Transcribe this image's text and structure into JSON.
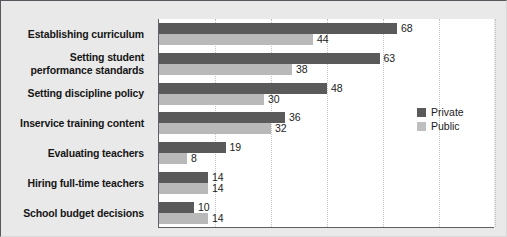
{
  "chart_data": {
    "type": "bar",
    "orientation": "horizontal",
    "title": "",
    "subtitle": "",
    "xlabel": "",
    "ylabel": "",
    "xlim": [
      0,
      96
    ],
    "grid": true,
    "gridline_values": [
      16,
      32,
      48,
      64,
      80,
      96
    ],
    "legend_position": "center-right",
    "categories": [
      "Establishing curriculum",
      "Setting student\nperformance standards",
      "Setting discipline policy",
      "Inservice training content",
      "Evaluating teachers",
      "Hiring full-time teachers",
      "School budget decisions"
    ],
    "series": [
      {
        "name": "Private",
        "color": "#5a5a5a",
        "values": [
          68,
          63,
          48,
          36,
          19,
          14,
          10
        ]
      },
      {
        "name": "Public",
        "color": "#b9b9b9",
        "values": [
          44,
          38,
          30,
          32,
          8,
          14,
          14
        ]
      }
    ]
  },
  "categories": [
    {
      "line1": "Establishing curriculum",
      "line2": ""
    },
    {
      "line1": "Setting student",
      "line2": "performance standards"
    },
    {
      "line1": "Setting discipline policy",
      "line2": ""
    },
    {
      "line1": "Inservice training content",
      "line2": ""
    },
    {
      "line1": "Evaluating teachers",
      "line2": ""
    },
    {
      "line1": "Hiring full-time teachers",
      "line2": ""
    },
    {
      "line1": "School budget decisions",
      "line2": ""
    }
  ],
  "value_labels": {
    "private": [
      "68",
      "63",
      "48",
      "36",
      "19",
      "14",
      "10"
    ],
    "public": [
      "44",
      "38",
      "30",
      "32",
      "8",
      "14",
      "14"
    ]
  },
  "legend": {
    "entries": [
      {
        "label": "Private",
        "color": "#5a5a5a"
      },
      {
        "label": "Public",
        "color": "#bfbfbf"
      }
    ]
  },
  "style": {
    "background": "#e9e9e9",
    "plot_background": "#ffffff",
    "axis_color": "#5d6064",
    "gridline_color": "#c2c2c2"
  }
}
